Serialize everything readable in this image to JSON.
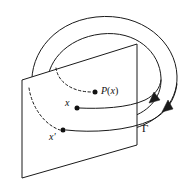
{
  "figure": {
    "background_color": "#ffffff",
    "stroke_color": "#1a1a1a",
    "width": 195,
    "height": 186
  },
  "labels": {
    "poincare_map": "P(x)",
    "poincare_map_function": "P",
    "poincare_map_open_paren": "(",
    "poincare_map_arg": "x",
    "poincare_map_close_paren": ")",
    "point_x": "x",
    "point_x_prime": "x",
    "point_x_prime_mark": "′",
    "orbit_gamma": "Γ"
  },
  "elements": {
    "outer_orbit": "outer-ellipse-loop",
    "inner_orbit": "inner-ellipse-loop",
    "transversal_plane": "transversal-section-plane",
    "trajectory_from_x": "solid-trajectory-arc-x",
    "trajectory_from_x_prime": "solid-trajectory-arc-x-prime",
    "hidden_trajectory_to_px": "dashed-trajectory-arc-px",
    "hidden_trajectory_to_x_prime": "dashed-trajectory-arc-x-prime",
    "flow_arrow_upper": "flow-direction-arrow-upper",
    "flow_arrow_lower": "flow-direction-arrow-lower"
  },
  "points": {
    "x": {
      "cx": 76,
      "cy": 108,
      "r": 2.5
    },
    "x_prime": {
      "cx": 63,
      "cy": 130,
      "r": 2.5
    },
    "P_of_x": {
      "cx": 95,
      "cy": 92,
      "r": 2.5
    }
  }
}
